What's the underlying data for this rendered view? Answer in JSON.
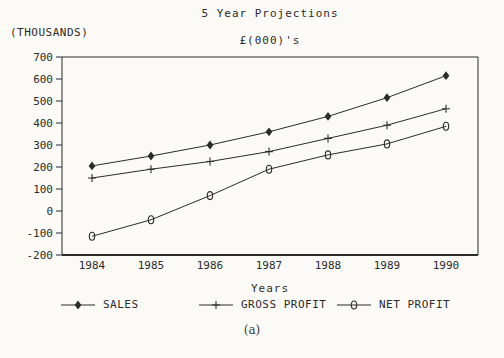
{
  "caption": "(a)",
  "colors": {
    "ink": "#2b2b2b",
    "paper": "#fbfaf7"
  },
  "chart_data": {
    "type": "line",
    "title": "5 Year Projections",
    "subtitle": "£(000)'s",
    "ylabel": "(THOUSANDS)",
    "xlabel": "Years",
    "x": [
      1984,
      1985,
      1986,
      1987,
      1988,
      1989,
      1990
    ],
    "ylim": [
      -200,
      700
    ],
    "yticks": [
      700,
      600,
      500,
      400,
      300,
      200,
      100,
      0,
      -100,
      -200
    ],
    "grid": false,
    "legend_position": "bottom",
    "series": [
      {
        "name": "SALES",
        "marker": "diamond",
        "values": [
          205,
          250,
          300,
          360,
          430,
          515,
          615
        ]
      },
      {
        "name": "GROSS PROFIT",
        "marker": "plus",
        "values": [
          150,
          190,
          225,
          270,
          330,
          390,
          465
        ]
      },
      {
        "name": "NET PROFIT",
        "marker": "zero",
        "values": [
          -115,
          -40,
          70,
          190,
          255,
          305,
          385
        ]
      }
    ]
  }
}
